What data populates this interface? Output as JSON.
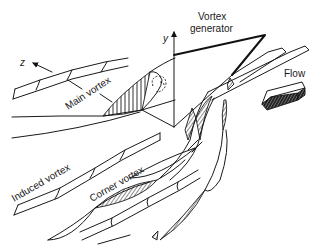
{
  "diagram": {
    "type": "vortex-generator-flow-schematic",
    "labels": {
      "vortex_generator": [
        "Vortex",
        "generator"
      ],
      "flow": "Flow",
      "main_vortex": "Main vortex",
      "induced_vortex": "Induced vortex",
      "corner_vortex": "Corner vortex",
      "axis_y": "y",
      "axis_z": "z"
    },
    "colors": {
      "line": "#1a1a1a",
      "background": "#ffffff"
    }
  }
}
